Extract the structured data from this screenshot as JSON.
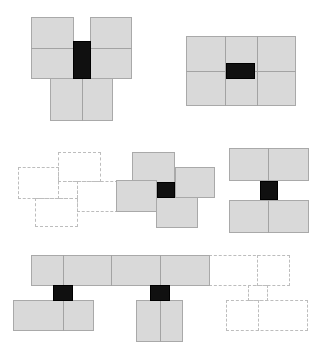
{
  "diagram": {
    "colors": {
      "panel_fill": "#d9d9d9",
      "panel_border": "#a9a9a9",
      "core": "#101010",
      "ghost_border": "#bdbdbd",
      "background": "#ffffff"
    },
    "groups": [
      {
        "id": "t-junction",
        "panels": [
          {
            "x": 31,
            "y": 17,
            "w": 43,
            "h": 62
          },
          {
            "x": 90,
            "y": 17,
            "w": 42,
            "h": 62
          },
          {
            "x": 50,
            "y": 78,
            "w": 63,
            "h": 43
          }
        ],
        "hdividers": [
          {
            "x": 31,
            "y": 48,
            "w": 101
          }
        ],
        "vdividers": [
          {
            "x": 82,
            "y": 78,
            "h": 43
          }
        ],
        "core": {
          "x": 73,
          "y": 41,
          "w": 18,
          "h": 38
        }
      },
      {
        "id": "grid-3x2",
        "panels": [
          {
            "x": 186,
            "y": 36,
            "w": 110,
            "h": 70
          }
        ],
        "hdividers": [
          {
            "x": 186,
            "y": 71,
            "w": 110
          }
        ],
        "vdividers": [
          {
            "x": 225,
            "y": 36,
            "h": 70
          },
          {
            "x": 257,
            "y": 36,
            "h": 70
          }
        ],
        "core": {
          "x": 226,
          "y": 63,
          "w": 29,
          "h": 16
        }
      },
      {
        "id": "pinwheel-ghost",
        "ghosts": [
          {
            "x": 58,
            "y": 152,
            "w": 43,
            "h": 30
          },
          {
            "x": 18,
            "y": 167,
            "w": 41,
            "h": 32
          },
          {
            "x": 77,
            "y": 181,
            "w": 41,
            "h": 31
          },
          {
            "x": 35,
            "y": 198,
            "w": 43,
            "h": 29
          },
          {
            "x": 58,
            "y": 181,
            "w": 20,
            "h": 18
          }
        ]
      },
      {
        "id": "pinwheel",
        "panels": [
          {
            "x": 132,
            "y": 152,
            "w": 43,
            "h": 31
          },
          {
            "x": 175,
            "y": 167,
            "w": 40,
            "h": 31
          },
          {
            "x": 116,
            "y": 180,
            "w": 41,
            "h": 32
          },
          {
            "x": 156,
            "y": 197,
            "w": 42,
            "h": 31
          }
        ],
        "core": {
          "x": 157,
          "y": 182,
          "w": 18,
          "h": 16
        }
      },
      {
        "id": "h-split",
        "panels": [
          {
            "x": 229,
            "y": 148,
            "w": 80,
            "h": 33
          },
          {
            "x": 229,
            "y": 200,
            "w": 80,
            "h": 33
          }
        ],
        "vdividers": [
          {
            "x": 268,
            "y": 148,
            "h": 33
          },
          {
            "x": 268,
            "y": 200,
            "h": 33
          }
        ],
        "core": {
          "x": 260,
          "y": 181,
          "w": 18,
          "h": 19
        }
      },
      {
        "id": "strip",
        "panels": [
          {
            "x": 31,
            "y": 255,
            "w": 179,
            "h": 31
          },
          {
            "x": 13,
            "y": 300,
            "w": 81,
            "h": 31
          },
          {
            "x": 136,
            "y": 300,
            "w": 47,
            "h": 42
          }
        ],
        "vdividers": [
          {
            "x": 63,
            "y": 255,
            "h": 31
          },
          {
            "x": 111,
            "y": 255,
            "h": 31
          },
          {
            "x": 160,
            "y": 255,
            "h": 31
          },
          {
            "x": 63,
            "y": 300,
            "h": 31
          },
          {
            "x": 160,
            "y": 300,
            "h": 42
          }
        ],
        "cores": [
          {
            "x": 53,
            "y": 285,
            "w": 20,
            "h": 16
          },
          {
            "x": 150,
            "y": 285,
            "w": 20,
            "h": 16
          }
        ],
        "ghosts": [
          {
            "x": 209,
            "y": 255,
            "w": 81,
            "h": 31
          },
          {
            "x": 248,
            "y": 285,
            "w": 20,
            "h": 16
          },
          {
            "x": 226,
            "y": 300,
            "w": 82,
            "h": 31
          }
        ],
        "ghost_vdividers": [
          {
            "x": 257,
            "y": 255,
            "h": 31
          },
          {
            "x": 258,
            "y": 300,
            "h": 31
          }
        ]
      }
    ]
  }
}
